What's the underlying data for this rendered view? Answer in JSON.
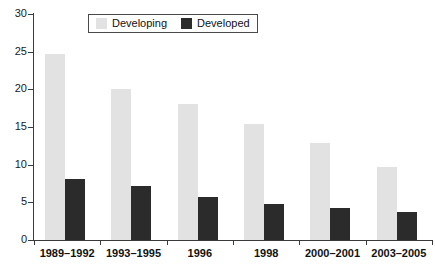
{
  "chart_data": {
    "type": "bar",
    "title": "",
    "subtitle": "",
    "xlabel": "",
    "ylabel": "",
    "categories": [
      "1989–1992",
      "1993–1995",
      "1996",
      "1998",
      "2000–2001",
      "2003–2005"
    ],
    "series": [
      {
        "name": "Developing",
        "color": "#e2e2e2",
        "values": [
          24.7,
          20.1,
          18.0,
          15.4,
          12.9,
          9.7
        ]
      },
      {
        "name": "Developed",
        "color": "#2b2b2b",
        "values": [
          8.1,
          7.2,
          5.7,
          4.8,
          4.3,
          3.7
        ]
      }
    ],
    "ylim": [
      0,
      30
    ],
    "yticks": [
      0,
      5,
      10,
      15,
      20,
      25,
      30
    ],
    "ytick_labels": [
      "0",
      "5",
      "10",
      "15",
      "20",
      "25",
      "30"
    ],
    "grid": false,
    "legend_position": "top-center",
    "annotations": []
  },
  "legend": {
    "entries": [
      {
        "label": "Developing",
        "swatch": "developing"
      },
      {
        "label": "Developed",
        "swatch": "developed"
      }
    ]
  }
}
